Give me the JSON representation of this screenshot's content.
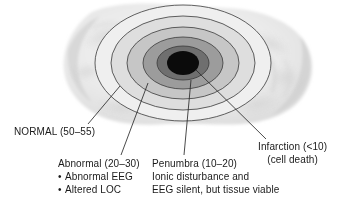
{
  "diagram": {
    "units": "cerebral blood flow (mL/100 g/min)",
    "colors": {
      "brain_tissue": "#e9e9e9",
      "zone_normal": "#efefef",
      "zone_outer_mid": "#dcdcdc",
      "zone_abnormal": "#c4c4c4",
      "zone_penumbra": "#9a9a9a",
      "zone_core_ring": "#6e6e6e",
      "zone_infarction": "#0b0b0b",
      "outline": "#3a3a3a",
      "leader_line": "#2a2a2a",
      "text": "#1a1a1a"
    }
  },
  "zones": [
    {
      "id": "normal",
      "label": "NORMAL (50–55)",
      "flow_range": "50-55",
      "fill": "#efefef"
    },
    {
      "id": "abnormal",
      "label": "Abnormal (20–30)",
      "flow_range": "20-30",
      "fill": "#c4c4c4"
    },
    {
      "id": "penumbra",
      "label": "Penumbra (10–20)",
      "flow_range": "10-20",
      "fill": "#9a9a9a"
    },
    {
      "id": "infarction",
      "label": "Infarction (<10)",
      "flow_range": "<10",
      "fill": "#0b0b0b"
    }
  ],
  "labels": {
    "normal": {
      "text": "NORMAL (50–55)"
    },
    "abnormal": {
      "heading": "Abnormal (20–30)",
      "bullets": [
        "Abnormal EEG",
        "Altered LOC"
      ]
    },
    "penumbra": {
      "heading": "Penumbra (10–20)",
      "line2": "Ionic disturbance and",
      "line3": "EEG silent, but tissue viable"
    },
    "infarction": {
      "heading": "Infarction (<10)",
      "line2": "(cell death)"
    }
  }
}
